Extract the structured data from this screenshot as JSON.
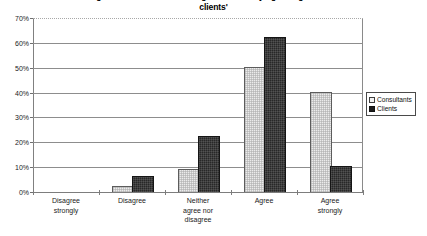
{
  "chart_data": {
    "type": "bar",
    "title": "Figure 2.5: 'Consultants are good at identifying change in their\nclients'",
    "title_line_1": "Figure 2.5: 'Consultants are good at identifying change in their",
    "title_line_2": "clients'",
    "xlabel": "",
    "ylabel": "",
    "ylim": [
      0,
      70
    ],
    "ytick_values": [
      70,
      60,
      50,
      40,
      30,
      20,
      10,
      0
    ],
    "ytick_labels": [
      "70%",
      "60%",
      "50%",
      "40%",
      "30%",
      "20%",
      "10%",
      "0%"
    ],
    "grid": true,
    "legend_position": "right",
    "categories": [
      "Disagree\nstrongly",
      "Disagree",
      "Neither\nagree nor\ndisagree",
      "Agree",
      "Agree\nstrongly"
    ],
    "series": [
      {
        "name": "Consultants",
        "color": "#ebebeb",
        "values": [
          0,
          2,
          9,
          50,
          40
        ]
      },
      {
        "name": "Clients",
        "color": "#282828",
        "values": [
          0,
          6,
          22,
          62,
          10
        ]
      }
    ]
  },
  "legend": {
    "items": [
      {
        "label": "Consultants"
      },
      {
        "label": "Clients"
      }
    ]
  }
}
